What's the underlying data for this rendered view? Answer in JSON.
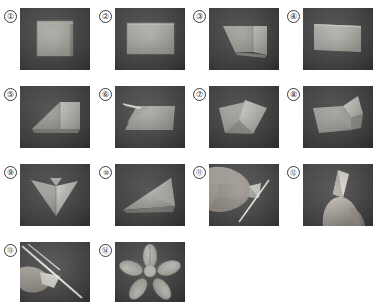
{
  "document": {
    "kind": "origami-instruction-sheet",
    "subject": "paper flower folding steps",
    "step_count": 14,
    "columns": 4,
    "rows": 4
  },
  "palette": {
    "page_background": "#ffffff",
    "photo_background_dark": "#4c4c4c",
    "photo_background_dark2": "#454545",
    "paper_light": "#b9b9b4",
    "paper_mid": "#9c9c97",
    "paper_shadow": "#7e7e7a",
    "paper_highlight": "#cfcfc9",
    "skin": "#b5aca4",
    "skin_shadow": "#8d857e",
    "metal": "#e6e6e2",
    "outline": "#3a3a3a"
  },
  "steps": [
    {
      "number": "1",
      "label": "①",
      "caption": "Square sheet of paper laid flat on dark surface",
      "photo": {
        "x": 20,
        "y": 8,
        "w": 70,
        "h": 62
      },
      "badge": {
        "x": 4,
        "y": 10
      }
    },
    {
      "number": "2",
      "label": "②",
      "caption": "Paper folded in half into a rectangle",
      "photo": {
        "x": 115,
        "y": 8,
        "w": 70,
        "h": 62
      },
      "badge": {
        "x": 99,
        "y": 10
      }
    },
    {
      "number": "3",
      "label": "③",
      "caption": "One corner folded down diagonally",
      "photo": {
        "x": 209,
        "y": 8,
        "w": 70,
        "h": 62
      },
      "badge": {
        "x": 193,
        "y": 10
      }
    },
    {
      "number": "4",
      "label": "④",
      "caption": "Flattened rectangle after the diagonal fold",
      "photo": {
        "x": 303,
        "y": 8,
        "w": 70,
        "h": 62
      },
      "badge": {
        "x": 287,
        "y": 10
      }
    },
    {
      "number": "5",
      "label": "⑤",
      "caption": "Triangular flap folded over the rectangle",
      "photo": {
        "x": 20,
        "y": 86,
        "w": 70,
        "h": 62
      },
      "badge": {
        "x": 4,
        "y": 88
      }
    },
    {
      "number": "6",
      "label": "⑥",
      "caption": "Edge lifted to open the fold",
      "photo": {
        "x": 115,
        "y": 86,
        "w": 70,
        "h": 62
      },
      "badge": {
        "x": 99,
        "y": 88
      }
    },
    {
      "number": "7",
      "label": "⑦",
      "caption": "Paper opened into two overlapping panels",
      "photo": {
        "x": 209,
        "y": 86,
        "w": 70,
        "h": 62
      },
      "badge": {
        "x": 193,
        "y": 88
      }
    },
    {
      "number": "8",
      "label": "⑧",
      "caption": "Corner pulled up forming a raised point",
      "photo": {
        "x": 303,
        "y": 86,
        "w": 70,
        "h": 62
      },
      "badge": {
        "x": 287,
        "y": 88
      }
    },
    {
      "number": "9",
      "label": "⑨",
      "caption": "Folded unit shaped like a pointed heart",
      "photo": {
        "x": 20,
        "y": 164,
        "w": 70,
        "h": 62
      },
      "badge": {
        "x": 4,
        "y": 166
      }
    },
    {
      "number": "10",
      "label": "⑩",
      "caption": "Unit folded into a narrow triangle",
      "photo": {
        "x": 115,
        "y": 164,
        "w": 70,
        "h": 62
      },
      "badge": {
        "x": 99,
        "y": 166
      }
    },
    {
      "number": "11",
      "label": "⑪",
      "caption": "Hand holding the folded unit while cutting with a blade",
      "photo": {
        "x": 209,
        "y": 164,
        "w": 70,
        "h": 62
      },
      "badge": {
        "x": 193,
        "y": 166
      }
    },
    {
      "number": "12",
      "label": "⑫",
      "caption": "Fingers pinching the trimmed petal shape",
      "photo": {
        "x": 303,
        "y": 164,
        "w": 70,
        "h": 62
      },
      "badge": {
        "x": 287,
        "y": 166
      }
    },
    {
      "number": "13",
      "label": "⑬",
      "caption": "Scissors trimming the petal edge",
      "photo": {
        "x": 20,
        "y": 242,
        "w": 70,
        "h": 60
      },
      "badge": {
        "x": 4,
        "y": 244
      }
    },
    {
      "number": "14",
      "label": "⑭",
      "caption": "Finished five-petal paper flower unfolded",
      "photo": {
        "x": 115,
        "y": 242,
        "w": 70,
        "h": 60
      },
      "badge": {
        "x": 99,
        "y": 244
      }
    }
  ]
}
